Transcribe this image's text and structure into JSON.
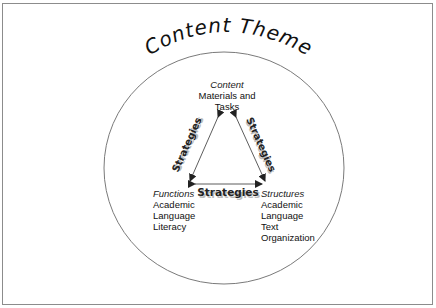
{
  "title": "Content Theme",
  "nodes": {
    "content": {
      "heading": "Content",
      "lines": [
        "Materials and",
        "Tasks"
      ]
    },
    "functions": {
      "heading": "Functions",
      "lines": [
        "Academic",
        "Language",
        "Literacy"
      ]
    },
    "structures": {
      "heading": "Structures",
      "lines": [
        "Academic",
        "Language",
        "Text",
        "Organization"
      ]
    }
  },
  "edges": {
    "left": "Strategies",
    "right": "Strategies",
    "bottom": "Strategies"
  },
  "colors": {
    "frame": "#8c8c8c",
    "circle": "#7a7a7a",
    "text": "#111111",
    "arrow": "#333333"
  }
}
